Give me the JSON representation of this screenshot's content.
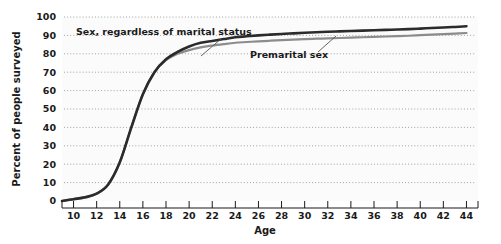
{
  "chart_data": {
    "type": "line",
    "title": "",
    "xlabel": "Age",
    "ylabel": "Percent of people surveyed",
    "xlim": [
      9,
      45
    ],
    "ylim": [
      0,
      100
    ],
    "grid": true,
    "grid_style": "dotted-horizontal",
    "legend_position": "inline-annotations",
    "x_ticks": [
      10,
      12,
      14,
      16,
      18,
      20,
      22,
      24,
      26,
      28,
      30,
      32,
      34,
      36,
      38,
      40,
      42,
      44
    ],
    "y_ticks": [
      0,
      10,
      20,
      30,
      40,
      50,
      60,
      70,
      80,
      90,
      100
    ],
    "x": [
      9,
      10,
      11,
      12,
      13,
      14,
      15,
      16,
      17,
      18,
      19,
      20,
      21,
      22,
      23,
      24,
      25,
      26,
      27,
      28,
      29,
      30,
      31,
      32,
      33,
      34,
      35,
      36,
      37,
      38,
      39,
      40,
      41,
      42,
      43,
      44
    ],
    "series": [
      {
        "name": "Sex, regardless of marital status",
        "color": "#2b2b2b",
        "values": [
          0,
          1,
          2,
          4,
          9,
          21,
          40,
          58,
          70,
          77,
          81,
          84,
          86,
          87,
          88,
          89,
          89.5,
          90,
          90.4,
          90.8,
          91.1,
          91.4,
          91.7,
          92,
          92.2,
          92.4,
          92.6,
          92.8,
          93,
          93.2,
          93.4,
          93.7,
          94,
          94.3,
          94.6,
          95
        ]
      },
      {
        "name": "Premarital sex",
        "color": "#8c8c8c",
        "values": [
          0,
          1,
          2,
          4,
          9,
          21,
          40,
          58,
          70,
          76.5,
          80,
          82,
          83.5,
          84.5,
          85.3,
          86,
          86.4,
          86.8,
          87.1,
          87.4,
          87.7,
          88,
          88.2,
          88.4,
          88.6,
          88.8,
          89,
          89.2,
          89.4,
          89.6,
          89.8,
          90.1,
          90.4,
          90.7,
          91,
          91.3
        ]
      }
    ],
    "annotations": [
      {
        "label": "Sex, regardless of marital status",
        "target_series": "Sex, regardless of marital status"
      },
      {
        "label": "Premarital sex",
        "target_series": "Premarital sex"
      }
    ]
  },
  "axes": {
    "y_title": "Percent of people surveyed",
    "x_title": "Age",
    "y_tick_labels": [
      "100",
      "90",
      "80",
      "70",
      "60",
      "50",
      "40",
      "30",
      "20",
      "10",
      "0"
    ],
    "x_tick_labels": [
      "10",
      "12",
      "14",
      "16",
      "18",
      "20",
      "22",
      "24",
      "26",
      "28",
      "30",
      "32",
      "34",
      "36",
      "38",
      "40",
      "42",
      "44"
    ]
  },
  "labels": {
    "upper_series": "Sex, regardless of marital status",
    "lower_series": "Premarital sex"
  },
  "colors": {
    "upper_line": "#2b2b2b",
    "lower_line": "#8c8c8c",
    "grid": "#9a9a9a",
    "axis": "#1a1a1a",
    "plot_background": "#fbfbfb",
    "page_background": "#ffffff"
  }
}
